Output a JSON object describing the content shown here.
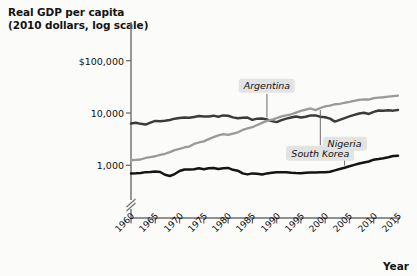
{
  "chart_data": {
    "type": "line",
    "title": "Real GDP per capita (2010 dollars, log scale)",
    "title_line1": "Real GDP per capita",
    "title_line2": "(2010 dollars, log scale)",
    "xlabel": "Year",
    "ylabel": "Real GDP per capita (2010 dollars, log scale)",
    "yscale": "log",
    "ylim": [
      500,
      150000
    ],
    "xlim": [
      1960,
      2015
    ],
    "grid": false,
    "legend_position": "inline-annotations",
    "axis_break": true,
    "ytick_labels": [
      "$100,000",
      "10,000",
      "1,000"
    ],
    "ytick_values": [
      100000,
      10000,
      1000
    ],
    "xtick_labels": [
      "1960",
      "1965",
      "1970",
      "1975",
      "1980",
      "1985",
      "1990",
      "1995",
      "2000",
      "2005",
      "2010",
      "2015"
    ],
    "xtick_values": [
      1960,
      1965,
      1970,
      1975,
      1980,
      1985,
      1990,
      1995,
      2000,
      2005,
      2010,
      2015
    ],
    "x": [
      1960,
      1961,
      1962,
      1963,
      1964,
      1965,
      1966,
      1967,
      1968,
      1969,
      1970,
      1971,
      1972,
      1973,
      1974,
      1975,
      1976,
      1977,
      1978,
      1979,
      1980,
      1981,
      1982,
      1983,
      1984,
      1985,
      1986,
      1987,
      1988,
      1989,
      1990,
      1991,
      1992,
      1993,
      1994,
      1995,
      1996,
      1997,
      1998,
      1999,
      2000,
      2001,
      2002,
      2003,
      2004,
      2005,
      2006,
      2007,
      2008,
      2009,
      2010,
      2011,
      2012,
      2013,
      2014,
      2015
    ],
    "series": [
      {
        "name": "Argentina",
        "color": "#3b3b3b",
        "label_x": 1988,
        "label_y": 33000,
        "values": [
          6300,
          6500,
          6200,
          6000,
          6550,
          7050,
          6950,
          7100,
          7350,
          7800,
          8000,
          8200,
          8150,
          8400,
          8750,
          8550,
          8600,
          8900,
          8500,
          9000,
          8850,
          8250,
          7950,
          8150,
          8200,
          7400,
          7800,
          7850,
          7500,
          7000,
          6700,
          7300,
          7800,
          8200,
          8600,
          8200,
          8500,
          9000,
          9000,
          8500,
          8300,
          7800,
          6850,
          7400,
          8000,
          8600,
          9200,
          9800,
          10100,
          9600,
          10500,
          11200,
          11100,
          11300,
          11100,
          11400
        ]
      },
      {
        "name": "South Korea",
        "color": "#9a9a9a",
        "label_x": 1999,
        "label_y": 1700,
        "values": [
          1250,
          1270,
          1290,
          1380,
          1440,
          1490,
          1580,
          1660,
          1790,
          1950,
          2060,
          2190,
          2280,
          2560,
          2730,
          2870,
          3160,
          3460,
          3740,
          3950,
          3820,
          4040,
          4280,
          4740,
          5060,
          5350,
          5880,
          6470,
          7080,
          7440,
          7990,
          8630,
          9020,
          9460,
          10160,
          10960,
          11650,
          12200,
          11350,
          12450,
          13400,
          13800,
          14700,
          15000,
          15700,
          16300,
          17100,
          17900,
          18200,
          18100,
          19200,
          19700,
          20000,
          20500,
          21000,
          21400
        ]
      },
      {
        "name": "Nigeria",
        "color": "#141414",
        "label_x": 2004,
        "label_y": 2600,
        "values": [
          700,
          705,
          715,
          740,
          745,
          760,
          745,
          660,
          625,
          680,
          780,
          830,
          830,
          840,
          880,
          840,
          880,
          890,
          850,
          880,
          890,
          820,
          790,
          700,
          670,
          700,
          690,
          665,
          700,
          720,
          740,
          735,
          735,
          720,
          710,
          705,
          720,
          725,
          730,
          735,
          740,
          755,
          800,
          850,
          900,
          960,
          1020,
          1080,
          1130,
          1180,
          1280,
          1320,
          1370,
          1430,
          1500,
          1530
        ]
      }
    ]
  },
  "layout": {
    "plot_left": 131,
    "plot_right": 398,
    "plot_top": 22,
    "plot_bottom": 218
  }
}
